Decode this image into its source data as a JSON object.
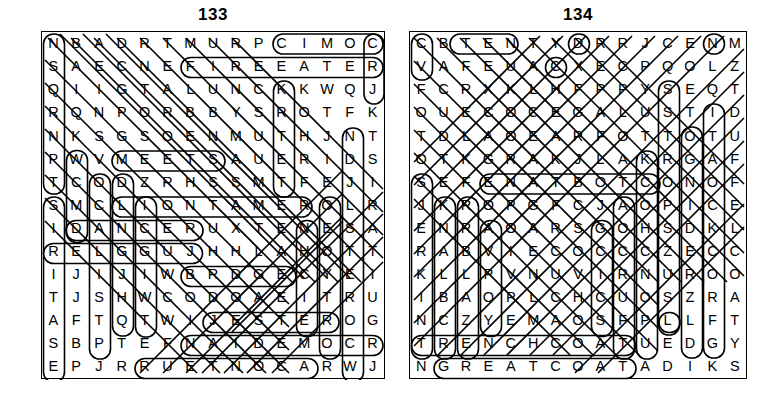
{
  "document": {
    "type": "word-search-puzzle-page",
    "puzzle_count": 2,
    "background_color": "#ffffff",
    "ink_color": "#000000"
  },
  "puzzles": [
    {
      "id": "133",
      "title": "133",
      "rows": 15,
      "cols": 15,
      "grid": [
        [
          "N",
          "B",
          "A",
          "D",
          "R",
          "T",
          "M",
          "U",
          "R",
          "P",
          "C",
          "I",
          "M",
          "O",
          "C"
        ],
        [
          "S",
          "A",
          "E",
          "C",
          "N",
          "E",
          "F",
          "I",
          "R",
          "E",
          "E",
          "A",
          "T",
          "E",
          "R"
        ],
        [
          "Q",
          "I",
          "I",
          "G",
          "T",
          "A",
          "L",
          "U",
          "N",
          "C",
          "K",
          "K",
          "W",
          "Q",
          "J"
        ],
        [
          "R",
          "Q",
          "N",
          "P",
          "O",
          "R",
          "B",
          "B",
          "Y",
          "S",
          "R",
          "O",
          "T",
          "F",
          "K"
        ],
        [
          "N",
          "K",
          "S",
          "G",
          "S",
          "O",
          "E",
          "N",
          "M",
          "U",
          "T",
          "H",
          "J",
          "N",
          "T"
        ],
        [
          "P",
          "W",
          "V",
          "M",
          "E",
          "E",
          "T",
          "S",
          "A",
          "U",
          "E",
          "R",
          "I",
          "D",
          "S"
        ],
        [
          "T",
          "C",
          "O",
          "D",
          "Z",
          "R",
          "H",
          "S",
          "S",
          "M",
          "T",
          "F",
          "E",
          "J",
          "I"
        ],
        [
          "S",
          "M",
          "C",
          "L",
          "I",
          "O",
          "N",
          "T",
          "A",
          "M",
          "E",
          "R",
          "O",
          "L",
          "R"
        ],
        [
          "I",
          "D",
          "A",
          "N",
          "C",
          "E",
          "R",
          "U",
          "X",
          "T",
          "E",
          "N",
          "E",
          "S",
          "A"
        ],
        [
          "R",
          "E",
          "L",
          "G",
          "G",
          "U",
          "J",
          "H",
          "H",
          "L",
          "A",
          "H",
          "O",
          "T",
          "T"
        ],
        [
          "I",
          "J",
          "I",
          "J",
          "I",
          "W",
          "B",
          "R",
          "D",
          "G",
          "E",
          "C",
          "Y",
          "E",
          "I"
        ],
        [
          "T",
          "J",
          "S",
          "H",
          "W",
          "C",
          "O",
          "D",
          "O",
          "A",
          "E",
          "I",
          "T",
          "R",
          "U"
        ],
        [
          "A",
          "F",
          "T",
          "Q",
          "T",
          "W",
          "I",
          "J",
          "E",
          "S",
          "T",
          "E",
          "R",
          "O",
          "G"
        ],
        [
          "S",
          "B",
          "P",
          "T",
          "E",
          "F",
          "N",
          "A",
          "I",
          "D",
          "E",
          "M",
          "O",
          "C",
          "R"
        ],
        [
          "E",
          "P",
          "J",
          "R",
          "R",
          "U",
          "E",
          "T",
          "N",
          "O",
          "C",
          "A",
          "R",
          "W",
          "J"
        ]
      ],
      "found_words": [
        "COMIC",
        "FIRE EATER",
        "LION TAMER",
        "DANCER",
        "JUGGLER",
        "JESTER",
        "COMEDIAN",
        "RACONTEUR",
        "MEETS",
        "BRIDGE"
      ]
    },
    {
      "id": "134",
      "title": "134",
      "rows": 15,
      "cols": 15,
      "grid": [
        [
          "C",
          "B",
          "T",
          "E",
          "N",
          "T",
          "Y",
          "D",
          "R",
          "R",
          "J",
          "C",
          "E",
          "N",
          "M"
        ],
        [
          "V",
          "A",
          "F",
          "E",
          "U",
          "A",
          "C",
          "X",
          "E",
          "C",
          "P",
          "Q",
          "O",
          "L",
          "Z"
        ],
        [
          "F",
          "C",
          "R",
          "X",
          "K",
          "L",
          "H",
          "F",
          "P",
          "P",
          "Y",
          "S",
          "E",
          "Q",
          "T"
        ],
        [
          "O",
          "U",
          "E",
          "C",
          "O",
          "C",
          "E",
          "G",
          "A",
          "L",
          "U",
          "S",
          "T",
          "I",
          "D"
        ],
        [
          "T",
          "D",
          "L",
          "A",
          "O",
          "E",
          "A",
          "R",
          "F",
          "O",
          "T",
          "T",
          "O",
          "T",
          "U"
        ],
        [
          "O",
          "T",
          "K",
          "G",
          "R",
          "A",
          "K",
          "J",
          "L",
          "A",
          "K",
          "R",
          "G",
          "A",
          "F"
        ],
        [
          "S",
          "E",
          "F",
          "E",
          "N",
          "A",
          "T",
          "B",
          "O",
          "T",
          "C",
          "O",
          "N",
          "O",
          "F"
        ],
        [
          "J",
          "K",
          "R",
          "O",
          "P",
          "G",
          "F",
          "C",
          "J",
          "A",
          "O",
          "P",
          "I",
          "C",
          "E"
        ],
        [
          "E",
          "N",
          "R",
          "A",
          "O",
          "A",
          "R",
          "S",
          "G",
          "O",
          "H",
          "S",
          "D",
          "K",
          "L"
        ],
        [
          "R",
          "A",
          "B",
          "V",
          "I",
          "E",
          "C",
          "O",
          "C",
          "C",
          "C",
          "Z",
          "E",
          "C",
          "C"
        ],
        [
          "K",
          "L",
          "L",
          "P",
          "V",
          "N",
          "U",
          "V",
          "I",
          "R",
          "N",
          "U",
          "R",
          "O",
          "O"
        ],
        [
          "I",
          "B",
          "A",
          "O",
          "P",
          "L",
          "C",
          "H",
          "C",
          "U",
          "O",
          "S",
          "Z",
          "R",
          "A"
        ],
        [
          "N",
          "C",
          "Z",
          "Y",
          "E",
          "M",
          "A",
          "O",
          "S",
          "F",
          "P",
          "L",
          "L",
          "F",
          "T"
        ],
        [
          "T",
          "R",
          "E",
          "N",
          "C",
          "H",
          "C",
          "O",
          "A",
          "T",
          "U",
          "E",
          "D",
          "G",
          "Y"
        ],
        [
          "N",
          "G",
          "R",
          "E",
          "A",
          "T",
          "C",
          "O",
          "A",
          "T",
          "A",
          "D",
          "I",
          "K",
          "S"
        ]
      ],
      "found_words": [
        "TRENCH COAT",
        "GREATCOAT",
        "DUFFEL",
        "JERKIN",
        "ANORAK",
        "TOGA",
        "OVERCOAT",
        "TAILCOAT",
        "SURCOAT",
        "CAPE"
      ]
    }
  ]
}
